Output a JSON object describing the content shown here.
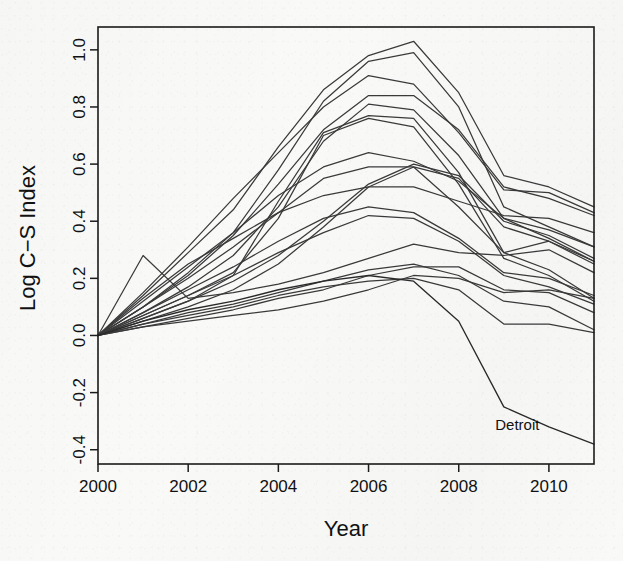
{
  "chart_data": {
    "type": "line",
    "title": "",
    "xlabel": "Year",
    "ylabel": "Log C−S Index",
    "xlim": [
      2000,
      2011
    ],
    "ylim": [
      -0.45,
      1.08
    ],
    "grid": false,
    "legend_position": "none",
    "x": [
      2000,
      2001,
      2002,
      2003,
      2004,
      2005,
      2006,
      2007,
      2008,
      2009,
      2010,
      2011
    ],
    "xticks": [
      2000,
      2002,
      2004,
      2006,
      2008,
      2010
    ],
    "xtick_labels": [
      "2000",
      "2002",
      "2004",
      "2006",
      "2008",
      "2010"
    ],
    "yticks": [
      -0.4,
      -0.2,
      0.0,
      0.2,
      0.4,
      0.6,
      0.8,
      1.0
    ],
    "ytick_labels": [
      "-0.4",
      "-0.2",
      "0.0",
      "0.2",
      "0.4",
      "0.6",
      "0.8",
      "1.0"
    ],
    "annotations": [
      {
        "text": "Detroit",
        "x": 2009.3,
        "y": -0.33,
        "series": "Detroit"
      }
    ],
    "series": [
      {
        "name": "LosAngeles",
        "values": [
          0.0,
          0.14,
          0.29,
          0.44,
          0.66,
          0.86,
          0.98,
          1.03,
          0.85,
          0.56,
          0.52,
          0.45
        ]
      },
      {
        "name": "Miami",
        "values": [
          0.0,
          0.1,
          0.22,
          0.36,
          0.58,
          0.82,
          0.96,
          0.99,
          0.8,
          0.45,
          0.38,
          0.31
        ]
      },
      {
        "name": "SanDiego",
        "values": [
          0.0,
          0.15,
          0.31,
          0.48,
          0.64,
          0.8,
          0.91,
          0.88,
          0.71,
          0.51,
          0.5,
          0.43
        ]
      },
      {
        "name": "Washington",
        "values": [
          0.0,
          0.1,
          0.21,
          0.35,
          0.53,
          0.72,
          0.84,
          0.84,
          0.72,
          0.52,
          0.48,
          0.42
        ]
      },
      {
        "name": "Tampa",
        "values": [
          0.0,
          0.08,
          0.17,
          0.28,
          0.45,
          0.68,
          0.81,
          0.79,
          0.63,
          0.41,
          0.34,
          0.26
        ]
      },
      {
        "name": "LasVegas",
        "values": [
          0.0,
          0.06,
          0.12,
          0.21,
          0.47,
          0.71,
          0.77,
          0.76,
          0.57,
          0.29,
          0.23,
          0.13
        ]
      },
      {
        "name": "Phoenix",
        "values": [
          0.0,
          0.07,
          0.14,
          0.22,
          0.41,
          0.7,
          0.76,
          0.73,
          0.53,
          0.27,
          0.21,
          0.12
        ]
      },
      {
        "name": "NewYork",
        "values": [
          0.0,
          0.12,
          0.24,
          0.36,
          0.49,
          0.59,
          0.64,
          0.61,
          0.54,
          0.41,
          0.37,
          0.31
        ]
      },
      {
        "name": "Boston",
        "values": [
          0.0,
          0.13,
          0.25,
          0.34,
          0.43,
          0.49,
          0.52,
          0.52,
          0.47,
          0.42,
          0.41,
          0.36
        ]
      },
      {
        "name": "SanFrancisco",
        "values": [
          0.0,
          0.1,
          0.2,
          0.31,
          0.43,
          0.55,
          0.59,
          0.59,
          0.45,
          0.29,
          0.33,
          0.26
        ]
      },
      {
        "name": "Seattle",
        "values": [
          0.0,
          0.06,
          0.12,
          0.19,
          0.28,
          0.4,
          0.53,
          0.6,
          0.56,
          0.4,
          0.35,
          0.27
        ]
      },
      {
        "name": "Portland",
        "values": [
          0.0,
          0.05,
          0.1,
          0.16,
          0.25,
          0.38,
          0.52,
          0.59,
          0.55,
          0.38,
          0.33,
          0.25
        ]
      },
      {
        "name": "Minneapolis",
        "values": [
          0.0,
          0.08,
          0.16,
          0.24,
          0.33,
          0.41,
          0.45,
          0.43,
          0.34,
          0.22,
          0.2,
          0.14
        ]
      },
      {
        "name": "Chicago",
        "values": [
          0.0,
          0.07,
          0.14,
          0.21,
          0.29,
          0.36,
          0.42,
          0.41,
          0.33,
          0.21,
          0.17,
          0.11
        ]
      },
      {
        "name": "Denver",
        "values": [
          0.0,
          0.28,
          0.13,
          0.15,
          0.18,
          0.22,
          0.27,
          0.32,
          0.29,
          0.28,
          0.3,
          0.22
        ]
      },
      {
        "name": "Atlanta",
        "values": [
          0.0,
          0.04,
          0.08,
          0.11,
          0.15,
          0.19,
          0.23,
          0.25,
          0.21,
          0.12,
          0.1,
          0.02
        ]
      },
      {
        "name": "Charlotte",
        "values": [
          0.0,
          0.03,
          0.06,
          0.09,
          0.13,
          0.16,
          0.21,
          0.24,
          0.24,
          0.16,
          0.15,
          0.08
        ]
      },
      {
        "name": "Dallas",
        "values": [
          0.0,
          0.03,
          0.05,
          0.07,
          0.09,
          0.12,
          0.16,
          0.21,
          0.2,
          0.15,
          0.16,
          0.13
        ]
      },
      {
        "name": "Cleveland",
        "values": [
          0.0,
          0.04,
          0.07,
          0.1,
          0.14,
          0.17,
          0.19,
          0.2,
          0.16,
          0.04,
          0.04,
          0.01
        ]
      },
      {
        "name": "Detroit",
        "values": [
          0.0,
          0.05,
          0.09,
          0.12,
          0.16,
          0.19,
          0.21,
          0.19,
          0.05,
          -0.25,
          -0.32,
          -0.38
        ]
      }
    ]
  },
  "plot_area": {
    "left": 98,
    "top": 27,
    "right": 594,
    "bottom": 464
  },
  "style": {
    "background": "#f9f9f8",
    "axis_color": "#1b1b1b",
    "line_color": "#3a3a3a"
  }
}
